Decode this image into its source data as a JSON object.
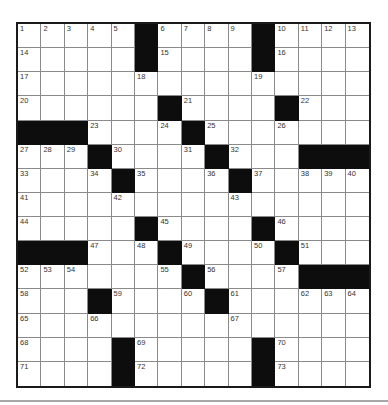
{
  "puzzle": {
    "rows": 15,
    "cols": 15,
    "colors": {
      "block": "#0d0d0d",
      "cell": "#ffffff",
      "grid_line": "#8a8a8a",
      "border": "#1a1a1a",
      "number": "#333333"
    },
    "grid": [
      [
        "1",
        "2",
        "3",
        "4",
        "5",
        "#",
        "6",
        "7",
        "8",
        "9",
        "#",
        "10",
        "11",
        "12",
        "13"
      ],
      [
        "14",
        "",
        "",
        "",
        "",
        "#",
        "15",
        "",
        "",
        "",
        "#",
        "16",
        "",
        "",
        ""
      ],
      [
        "17",
        "",
        "",
        "",
        "",
        "18",
        "",
        "",
        "",
        "",
        "19",
        "",
        "",
        "",
        ""
      ],
      [
        "20",
        "",
        "",
        "",
        "",
        "",
        "#",
        "21",
        "",
        "",
        "",
        "#",
        "22",
        "",
        ""
      ],
      [
        "#",
        "#",
        "#",
        "23",
        "",
        "",
        "24",
        "#",
        "25",
        "",
        "",
        "26",
        "",
        "",
        ""
      ],
      [
        "27",
        "28",
        "29",
        "#",
        "30",
        "",
        "",
        "31",
        "#",
        "32",
        "",
        "",
        "#",
        "#",
        "#"
      ],
      [
        "33",
        "",
        "",
        "34",
        "#",
        "35",
        "",
        "",
        "36",
        "#",
        "37",
        "",
        "38",
        "39",
        "40"
      ],
      [
        "41",
        "",
        "",
        "",
        "42",
        "",
        "",
        "",
        "",
        "43",
        "",
        "",
        "",
        "",
        ""
      ],
      [
        "44",
        "",
        "",
        "",
        "",
        "#",
        "45",
        "",
        "",
        "",
        "#",
        "46",
        "",
        "",
        ""
      ],
      [
        "#",
        "#",
        "#",
        "47",
        "",
        "48",
        "#",
        "49",
        "",
        "",
        "50",
        "#",
        "51",
        "",
        ""
      ],
      [
        "52",
        "53",
        "54",
        "",
        "",
        "",
        "55",
        "#",
        "56",
        "",
        "",
        "57",
        "#",
        "#",
        "#"
      ],
      [
        "58",
        "",
        "",
        "#",
        "59",
        "",
        "",
        "60",
        "#",
        "61",
        "",
        "",
        "62",
        "63",
        "64"
      ],
      [
        "65",
        "",
        "",
        "66",
        "",
        "",
        "",
        "",
        "",
        "67",
        "",
        "",
        "",
        "",
        ""
      ],
      [
        "68",
        "",
        "",
        "",
        "#",
        "69",
        "",
        "",
        "",
        "",
        "#",
        "70",
        "",
        "",
        ""
      ],
      [
        "71",
        "",
        "",
        "",
        "#",
        "72",
        "",
        "",
        "",
        "",
        "#",
        "73",
        "",
        "",
        ""
      ]
    ]
  }
}
